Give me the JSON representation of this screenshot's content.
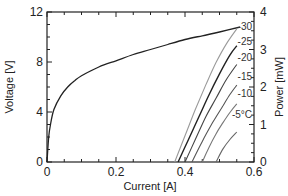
{
  "chart_data": {
    "type": "line",
    "title": "",
    "xlabel": "Current [A]",
    "ylabel": "Voltage [V]",
    "y2label": "Power [mW]",
    "xlim": [
      0,
      0.6
    ],
    "ylim": [
      0,
      12
    ],
    "y2lim": [
      0,
      4
    ],
    "xticks": [
      "0",
      "0.2",
      "0.4",
      "0.6"
    ],
    "yticks": [
      "0",
      "4",
      "8",
      "12"
    ],
    "y2ticks": [
      "0",
      "1",
      "2",
      "3",
      "4"
    ],
    "grid": false,
    "legend": "inline labels at right ends of power curves",
    "voltage_series": {
      "name": "Voltage",
      "axis": "left",
      "x": [
        0.0,
        0.005,
        0.01,
        0.02,
        0.04,
        0.06,
        0.08,
        0.1,
        0.15,
        0.2,
        0.25,
        0.3,
        0.35,
        0.4,
        0.45,
        0.5,
        0.56
      ],
      "y": [
        0.0,
        2.0,
        3.0,
        4.2,
        5.3,
        6.0,
        6.5,
        6.9,
        7.6,
        8.1,
        8.6,
        9.0,
        9.4,
        9.8,
        10.1,
        10.4,
        10.8
      ]
    },
    "series": [
      {
        "name": "-30",
        "axis": "right",
        "x": [
          0.37,
          0.4,
          0.43,
          0.46,
          0.49,
          0.52,
          0.55
        ],
        "y": [
          0.0,
          0.7,
          1.4,
          2.05,
          2.65,
          3.15,
          3.55
        ]
      },
      {
        "name": "-25",
        "axis": "right",
        "x": [
          0.38,
          0.41,
          0.44,
          0.47,
          0.5,
          0.53,
          0.55
        ],
        "y": [
          0.0,
          0.6,
          1.2,
          1.8,
          2.35,
          2.85,
          3.1
        ]
      },
      {
        "name": "-20",
        "axis": "right",
        "x": [
          0.4,
          0.43,
          0.46,
          0.49,
          0.52,
          0.55
        ],
        "y": [
          0.0,
          0.6,
          1.2,
          1.7,
          2.2,
          2.6
        ]
      },
      {
        "name": "-15",
        "axis": "right",
        "x": [
          0.42,
          0.45,
          0.48,
          0.51,
          0.53,
          0.55
        ],
        "y": [
          0.0,
          0.55,
          1.05,
          1.5,
          1.8,
          2.05
        ]
      },
      {
        "name": "-10",
        "axis": "right",
        "x": [
          0.45,
          0.47,
          0.49,
          0.51,
          0.53,
          0.55
        ],
        "y": [
          0.0,
          0.4,
          0.75,
          1.05,
          1.32,
          1.55
        ]
      },
      {
        "name": "-5°C",
        "axis": "right",
        "x": [
          0.49,
          0.51,
          0.53,
          0.55
        ],
        "y": [
          0.0,
          0.35,
          0.6,
          0.8
        ]
      }
    ],
    "series_colors": [
      "#9a9a9a",
      "#222222",
      "#444444",
      "#555555",
      "#777777",
      "#666666"
    ],
    "voltage_color": "#222222"
  }
}
